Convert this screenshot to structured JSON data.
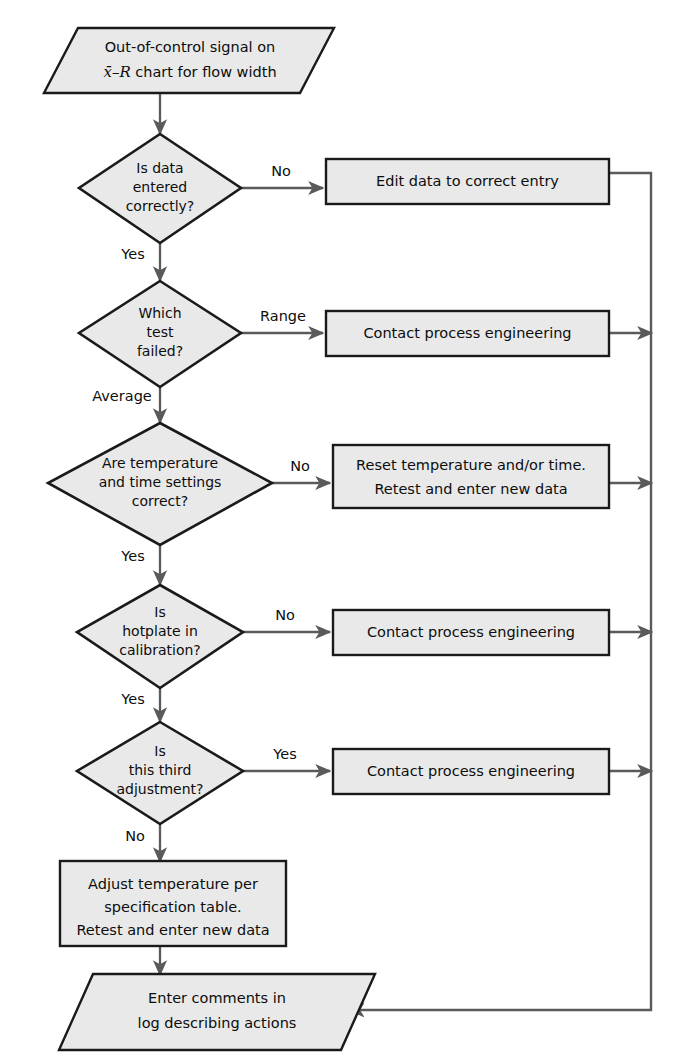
{
  "diagram": {
    "type": "flowchart",
    "canvas": {
      "width": 679,
      "height": 1064
    },
    "colors": {
      "node_fill": "#e9e9e9",
      "node_stroke": "#1a1a1a",
      "connector": "#5a5a5a",
      "background": "#ffffff",
      "text": "#0d0d0d"
    }
  },
  "nodes": {
    "start": {
      "shape": "parallelogram",
      "line1": "Out-of-control signal on",
      "line2_prefix": "x",
      "line2_mid": "–R",
      "line2_suffix": " chart for flow width"
    },
    "decision1": {
      "shape": "diamond",
      "line1": "Is data",
      "line2": "entered",
      "line3": "correctly?"
    },
    "decision2": {
      "shape": "diamond",
      "line1": "Which",
      "line2": "test",
      "line3": "failed?"
    },
    "decision3": {
      "shape": "diamond",
      "line1": "Are temperature",
      "line2": "and time settings",
      "line3": "correct?"
    },
    "decision4": {
      "shape": "diamond",
      "line1": "Is",
      "line2": "hotplate in",
      "line3": "calibration?"
    },
    "decision5": {
      "shape": "diamond",
      "line1": "Is",
      "line2": "this third",
      "line3": "adjustment?"
    },
    "process1": {
      "shape": "rectangle",
      "line1": "Edit data to correct entry"
    },
    "process2": {
      "shape": "rectangle",
      "line1": "Contact process engineering"
    },
    "process3": {
      "shape": "rectangle",
      "line1": "Reset temperature and/or time.",
      "line2": "Retest and enter new data"
    },
    "process4": {
      "shape": "rectangle",
      "line1": "Contact process engineering"
    },
    "process5": {
      "shape": "rectangle",
      "line1": "Contact process engineering"
    },
    "process6": {
      "shape": "rectangle",
      "line1": "Adjust temperature per",
      "line2": "specification table.",
      "line3": "Retest and enter new data"
    },
    "end": {
      "shape": "parallelogram",
      "line1": "Enter comments in",
      "line2": "log describing actions"
    }
  },
  "edge_labels": {
    "d1_no": "No",
    "d1_yes": "Yes",
    "d2_range": "Range",
    "d2_average": "Average",
    "d3_no": "No",
    "d3_yes": "Yes",
    "d4_no": "No",
    "d4_yes": "Yes",
    "d5_yes": "Yes",
    "d5_no": "No"
  }
}
